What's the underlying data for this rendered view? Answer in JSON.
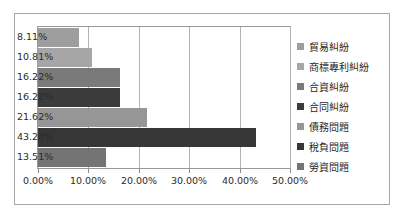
{
  "chart_data": {
    "type": "bar",
    "orientation": "horizontal",
    "title": "",
    "xlabel": "",
    "ylabel": "",
    "xlim": [
      0,
      50
    ],
    "grid": true,
    "legend_position": "right",
    "categories": [
      "貿易糾紛",
      "商標專利糾紛",
      "合資糾紛",
      "合同糾紛",
      "債務問題",
      "稅負問題",
      "勞資問題"
    ],
    "values": [
      8.11,
      10.81,
      16.22,
      16.22,
      21.62,
      43.24,
      13.51
    ],
    "data_labels": [
      "8.11%",
      "10.81%",
      "16.22%",
      "16.22%",
      "21.62%",
      "43.24%",
      "13.51%"
    ],
    "bar_colors": [
      "#9e9e9e",
      "#a6a6a6",
      "#7a7a7a",
      "#3b3b3b",
      "#969696",
      "#363636",
      "#747474"
    ],
    "xticks": [
      0,
      10,
      20,
      30,
      40,
      50
    ],
    "xtick_labels": [
      "0.00%",
      "10.00%",
      "20.00%",
      "30.00%",
      "40.00%",
      "50.00%"
    ]
  },
  "legend": {
    "items": [
      {
        "label": "貿易糾紛",
        "color": "#9e9e9e"
      },
      {
        "label": "商標專利糾紛",
        "color": "#a6a6a6"
      },
      {
        "label": "合資糾紛",
        "color": "#7a7a7a"
      },
      {
        "label": "合同糾紛",
        "color": "#3b3b3b"
      },
      {
        "label": "債務問題",
        "color": "#969696"
      },
      {
        "label": "稅負問題",
        "color": "#363636"
      },
      {
        "label": "勞資問題",
        "color": "#747474"
      }
    ]
  },
  "style": {
    "frame_border_color": "#a8a8a8",
    "plot_border_color": "#9a9a9a",
    "gridline_color": "#b5b5b5",
    "text_color": "#2b2b2b",
    "background": "#ffffff"
  }
}
